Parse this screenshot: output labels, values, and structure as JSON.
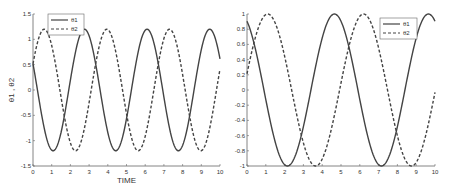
{
  "chart_data": [
    {
      "type": "line",
      "title": "",
      "xlabel": "TIME",
      "ylabel": "θ1 , θ2",
      "xlim": [
        0,
        10
      ],
      "ylim": [
        -1.5,
        1.5
      ],
      "xticks": [
        0,
        1,
        2,
        3,
        4,
        5,
        6,
        7,
        8,
        9,
        10
      ],
      "yticks": [
        -1.5,
        -1,
        -0.5,
        0,
        0.5,
        1,
        1.5
      ],
      "ytick_labels": [
        "-1.5",
        "-1",
        "-0.5",
        "0",
        "0.5",
        "1",
        "1.5"
      ],
      "grid": false,
      "legend_position": "upper left",
      "series": [
        {
          "name": "θ1",
          "style": "solid",
          "amplitude": 1.2,
          "period": 3.35,
          "peak_at": 2.75,
          "x": [
            0,
            1.05,
            2.75,
            4.4,
            6.1,
            7.75,
            9.45,
            10
          ],
          "values": [
            0.5,
            -1.2,
            1.2,
            -1.2,
            1.2,
            -1.2,
            1.2,
            0.6
          ]
        },
        {
          "name": "θ2",
          "style": "dashed",
          "amplitude": 1.2,
          "period": 3.35,
          "peak_at": 0.6,
          "x": [
            0,
            0.6,
            2.25,
            3.95,
            5.6,
            7.3,
            8.95,
            10
          ],
          "values": [
            0.6,
            1.2,
            -1.2,
            1.2,
            -1.2,
            1.2,
            -1.2,
            0.6
          ]
        }
      ]
    },
    {
      "type": "line",
      "title": "",
      "xlabel": "",
      "ylabel": "",
      "xlim": [
        0,
        10
      ],
      "ylim": [
        -1,
        1
      ],
      "xticks": [
        0,
        1,
        2,
        3,
        4,
        5,
        6,
        7,
        8,
        9,
        10
      ],
      "yticks": [
        -1,
        -0.8,
        -0.6,
        -0.4,
        -0.2,
        0,
        0.2,
        0.4,
        0.6,
        0.8,
        1
      ],
      "ytick_labels": [
        "-1",
        "-0.8",
        "-0.6",
        "-0.4",
        "-0.2",
        "0",
        "0.2",
        "0.4",
        "0.6",
        "0.8",
        "1"
      ],
      "grid": false,
      "legend_position": "upper right",
      "series": [
        {
          "name": "θ1",
          "style": "solid",
          "amplitude": 1.0,
          "period": 5.0,
          "peak_at": 4.65,
          "x": [
            0,
            2.15,
            4.65,
            7.15,
            9.65,
            10
          ],
          "values": [
            0.9,
            -1,
            1,
            -1,
            1,
            0.9
          ]
        },
        {
          "name": "θ2",
          "style": "dashed",
          "amplitude": 1.0,
          "period": 5.1,
          "peak_at": 1.1,
          "x": [
            0,
            1.1,
            3.65,
            6.2,
            8.75,
            10
          ],
          "values": [
            0.35,
            1,
            -1,
            1,
            -1,
            0.3
          ]
        }
      ]
    }
  ],
  "plots": [
    {
      "xlabel": "TIME",
      "ylabel": "θ1 , θ2",
      "legend": [
        "θ1",
        "θ2"
      ]
    },
    {
      "xlabel": "",
      "ylabel": "",
      "legend": [
        "θ1",
        "θ2"
      ]
    }
  ],
  "colors": {
    "line": "#444444",
    "axis": "#666666",
    "background": "#ffffff"
  }
}
